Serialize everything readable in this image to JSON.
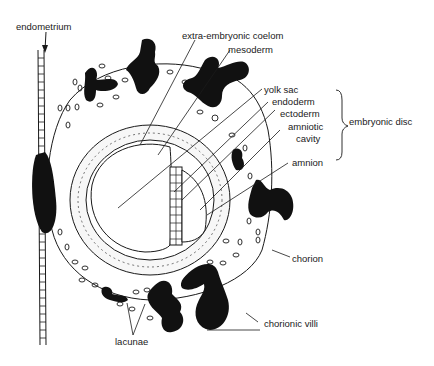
{
  "diagram": {
    "type": "anatomical-diagram",
    "colors": {
      "ink": "#1a1a1a",
      "background": "#ffffff"
    },
    "labels": {
      "endometrium": "endometrium",
      "extra_embryonic_coelom": "extra-embryonic coelom",
      "mesoderm": "mesoderm",
      "yolk_sac": "yolk sac",
      "endoderm": "endoderm",
      "ectoderm": "ectoderm",
      "amniotic_cavity_1": "amniotic",
      "amniotic_cavity_2": "cavity",
      "embryonic_disc": "embryonic disc",
      "amnion": "amnion",
      "chorion": "chorion",
      "chorionic_villi": "chorionic villi",
      "lacunae": "lacunae"
    }
  }
}
